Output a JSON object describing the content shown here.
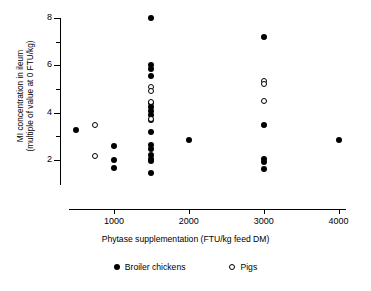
{
  "chart_data": {
    "type": "scatter",
    "title": "",
    "xlabel": "Phytase supplementation (FTU/kg feed DM)",
    "ylabel_line1": "MI concentration in ileum",
    "ylabel_line2": "(multiple of value at 0 FTU/kg)",
    "xlim": [
      400,
      4100
    ],
    "ylim": [
      1.2,
      8.2
    ],
    "xticks": [
      1000,
      2000,
      3000,
      4000
    ],
    "xtick_labels": [
      "1000",
      "2000",
      "3000",
      "4000"
    ],
    "yticks": [
      2,
      4,
      6,
      8
    ],
    "ytick_labels": [
      "2",
      "4",
      "6",
      "8"
    ],
    "yticks_minor": [
      3,
      5,
      7
    ],
    "grid": false,
    "legend_position": "bottom-center",
    "marker_color": "#000000",
    "background": "#ffffff",
    "series": [
      {
        "name": "Broiler chickens",
        "marker": "filled-circle",
        "color": "#000000",
        "points": [
          {
            "x": 500,
            "y": 3.25
          },
          {
            "x": 1000,
            "y": 2.6
          },
          {
            "x": 1000,
            "y": 2.0
          },
          {
            "x": 1000,
            "y": 1.65
          },
          {
            "x": 1500,
            "y": 8.0
          },
          {
            "x": 1500,
            "y": 6.0
          },
          {
            "x": 1500,
            "y": 5.85
          },
          {
            "x": 1500,
            "y": 5.55
          },
          {
            "x": 1500,
            "y": 4.4
          },
          {
            "x": 1500,
            "y": 4.25
          },
          {
            "x": 1500,
            "y": 4.05
          },
          {
            "x": 1500,
            "y": 3.9
          },
          {
            "x": 1500,
            "y": 3.7
          },
          {
            "x": 1500,
            "y": 3.2
          },
          {
            "x": 1500,
            "y": 2.65
          },
          {
            "x": 1500,
            "y": 2.45
          },
          {
            "x": 1500,
            "y": 2.2
          },
          {
            "x": 1500,
            "y": 2.05
          },
          {
            "x": 1500,
            "y": 1.95
          },
          {
            "x": 1500,
            "y": 1.45
          },
          {
            "x": 2000,
            "y": 2.85
          },
          {
            "x": 3000,
            "y": 7.2
          },
          {
            "x": 3000,
            "y": 3.5
          },
          {
            "x": 3000,
            "y": 2.05
          },
          {
            "x": 3000,
            "y": 1.9
          },
          {
            "x": 3000,
            "y": 1.6
          },
          {
            "x": 4000,
            "y": 2.85
          }
        ]
      },
      {
        "name": "Pigs",
        "marker": "open-circle",
        "color": "#000000",
        "points": [
          {
            "x": 750,
            "y": 3.5
          },
          {
            "x": 750,
            "y": 2.15
          },
          {
            "x": 1500,
            "y": 5.1
          },
          {
            "x": 1500,
            "y": 4.9
          },
          {
            "x": 1500,
            "y": 4.45
          },
          {
            "x": 1500,
            "y": 3.75
          },
          {
            "x": 3000,
            "y": 5.35
          },
          {
            "x": 3000,
            "y": 5.2
          },
          {
            "x": 3000,
            "y": 4.5
          }
        ]
      }
    ]
  }
}
